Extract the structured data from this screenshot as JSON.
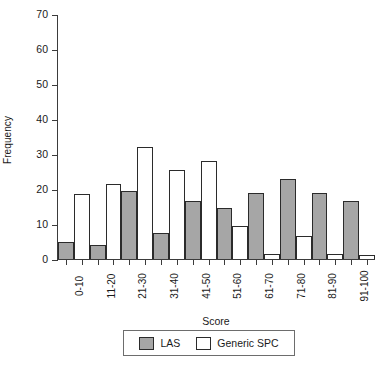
{
  "chart_data": {
    "type": "bar",
    "title": "",
    "xlabel": "Score",
    "ylabel": "Frequency",
    "categories": [
      "0-10",
      "11-20",
      "21-30",
      "31-40",
      "41-50",
      "51-60",
      "61-70",
      "71-80",
      "81-90",
      "91-100"
    ],
    "series": [
      {
        "name": "LAS",
        "color": "#a6a6a6",
        "values": [
          5,
          4,
          19.5,
          7.5,
          16.5,
          14.5,
          19,
          23,
          19,
          16.5
        ]
      },
      {
        "name": "Generic SPC",
        "color": "#ffffff",
        "values": [
          18.5,
          21.5,
          32,
          25.5,
          28,
          9.5,
          1.5,
          6.5,
          1.5,
          1.2
        ]
      }
    ],
    "ylim": [
      0,
      70
    ],
    "yticks": [
      0,
      10,
      20,
      30,
      40,
      50,
      60,
      70
    ],
    "ytick_labels": [
      "0",
      "10",
      "20",
      "30",
      "40",
      "50",
      "60",
      "70"
    ],
    "grid": false,
    "legend_position": "bottom"
  },
  "legend": {
    "items": [
      {
        "label": "LAS",
        "swatch": "gray-filled-swatch"
      },
      {
        "label": "Generic SPC",
        "swatch": "white-open-swatch"
      }
    ]
  }
}
